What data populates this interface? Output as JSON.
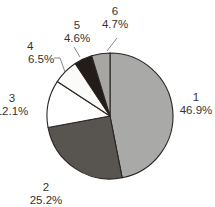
{
  "chart_data": {
    "type": "pie",
    "title": "",
    "categories": [
      "1",
      "2",
      "3",
      "4",
      "5",
      "6"
    ],
    "values": [
      46.9,
      25.2,
      12.1,
      6.5,
      4.6,
      4.7
    ],
    "value_labels": [
      "46.9%",
      "25.2%",
      "12.1%",
      "6.5%",
      "4.6%",
      "4.7%"
    ],
    "colors": [
      "#a9a9a7",
      "#58544f",
      "#ffffff",
      "#fbfbf9",
      "#231c18",
      "#a8a6a2"
    ],
    "start_angle_deg": 0,
    "direction": "clockwise",
    "legend": "none",
    "label_positions": [
      {
        "x": 196,
        "y": 103
      },
      {
        "x": 46,
        "y": 193
      },
      {
        "x": 12,
        "y": 104
      },
      {
        "x": 44,
        "y": 52
      },
      {
        "x": 77,
        "y": 31
      },
      {
        "x": 115,
        "y": 18
      }
    ]
  },
  "pie": {
    "cx": 110,
    "cy": 116,
    "r": 63,
    "stroke": "#2a2522"
  },
  "labels": [
    {
      "name": "1",
      "pct": "46.9%"
    },
    {
      "name": "2",
      "pct": "25.2%"
    },
    {
      "name": "3",
      "pct": "12.1%"
    },
    {
      "name": "4",
      "pct": "6.5%"
    },
    {
      "name": "5",
      "pct": "4.6%"
    },
    {
      "name": "6",
      "pct": "4.7%"
    }
  ]
}
